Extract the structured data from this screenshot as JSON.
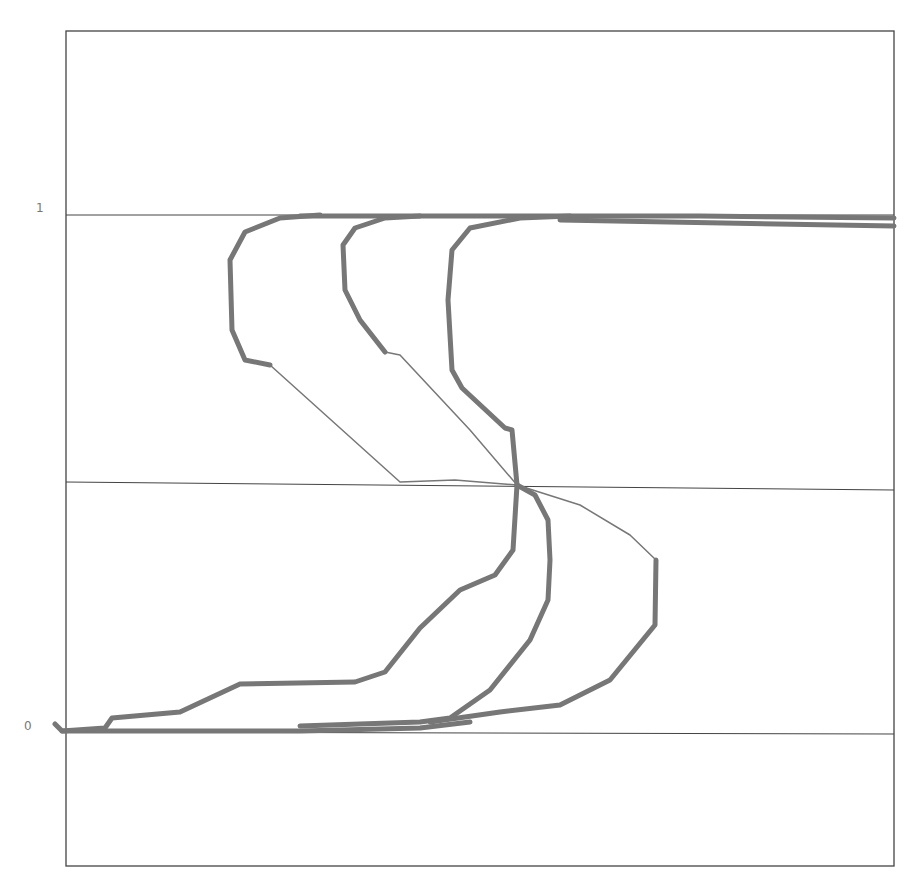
{
  "chart_data": {
    "type": "line",
    "title": "",
    "xlabel": "",
    "ylabel": "",
    "ylim": [
      -0.25,
      1.4
    ],
    "yticks": [
      {
        "value": 0,
        "label": "0"
      },
      {
        "value": 1,
        "label": "1"
      }
    ],
    "xticks": [],
    "grid": "horizontal reference lines at y=0, y=0.5, y=1",
    "legend": null,
    "style": {
      "line_color": "#777777",
      "frame_color": "#444444",
      "thick_width": 5,
      "thin_width": 1.5
    },
    "series": [
      {
        "name": "loop-left",
        "points_normalized": [
          [
            0.0,
            0.0
          ],
          [
            0.06,
            0.02
          ],
          [
            0.21,
            0.09
          ],
          [
            0.36,
            0.1
          ],
          [
            0.4,
            0.16
          ],
          [
            0.49,
            0.31
          ],
          [
            0.55,
            0.35
          ],
          [
            0.56,
            0.45
          ],
          [
            0.55,
            0.5
          ],
          [
            0.41,
            0.51
          ],
          [
            0.25,
            0.72
          ],
          [
            0.2,
            0.75
          ],
          [
            0.19,
            0.85
          ],
          [
            0.2,
            0.95
          ],
          [
            0.27,
            1.0
          ],
          [
            1.0,
            1.0
          ]
        ]
      },
      {
        "name": "loop-middle",
        "points_normalized": [
          [
            0.0,
            0.0
          ],
          [
            0.37,
            0.01
          ],
          [
            0.47,
            0.03
          ],
          [
            0.55,
            0.13
          ],
          [
            0.59,
            0.26
          ],
          [
            0.59,
            0.45
          ],
          [
            0.55,
            0.5
          ],
          [
            0.47,
            0.6
          ],
          [
            0.39,
            0.72
          ],
          [
            0.34,
            0.8
          ],
          [
            0.34,
            0.95
          ],
          [
            0.41,
            1.0
          ],
          [
            1.0,
            0.99
          ]
        ]
      },
      {
        "name": "loop-right",
        "points_normalized": [
          [
            0.0,
            0.0
          ],
          [
            0.28,
            0.0
          ],
          [
            0.52,
            0.03
          ],
          [
            0.63,
            0.12
          ],
          [
            0.71,
            0.21
          ],
          [
            0.71,
            0.33
          ],
          [
            0.66,
            0.41
          ],
          [
            0.55,
            0.5
          ],
          [
            0.54,
            0.58
          ],
          [
            0.47,
            0.67
          ],
          [
            0.46,
            0.8
          ],
          [
            0.49,
            0.95
          ],
          [
            0.57,
            1.0
          ],
          [
            1.0,
            0.98
          ]
        ]
      }
    ]
  },
  "axes": {
    "y_label_top": "1",
    "y_label_bottom": "0"
  }
}
